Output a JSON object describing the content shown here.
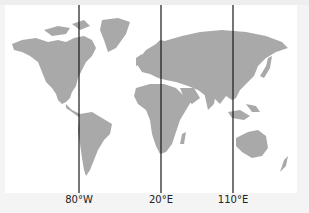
{
  "map": {
    "title": "",
    "land_color": "#a9a9a9",
    "line_color": "#1a1a1a",
    "meridians": [
      {
        "label": "80°W",
        "x": 79
      },
      {
        "label": "20°E",
        "x": 161
      },
      {
        "label": "110°E",
        "x": 233
      }
    ]
  }
}
